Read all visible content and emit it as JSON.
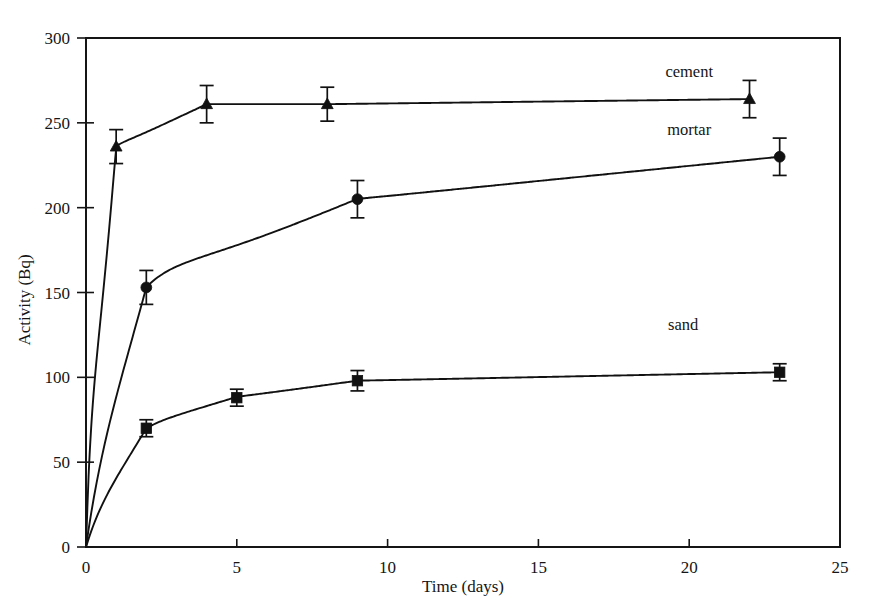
{
  "chart_data": {
    "type": "line",
    "title": "",
    "subtitle": "",
    "xlabel": "Time (days)",
    "ylabel": "Activity (Bq)",
    "xlim": [
      0,
      25
    ],
    "ylim": [
      0,
      300
    ],
    "xticks": [
      0,
      5,
      10,
      15,
      20,
      25
    ],
    "xtick_labels": [
      "0",
      "5",
      "10",
      "15",
      "20",
      "25"
    ],
    "yticks": [
      0,
      50,
      100,
      150,
      200,
      250,
      300
    ],
    "ytick_labels": [
      "0",
      "50",
      "100",
      "150",
      "200",
      "250",
      "300"
    ],
    "grid": false,
    "legend_position": "inline-right-of-curve",
    "marker_colors": {
      "cement": "#111111",
      "mortar": "#111111",
      "sand": "#111111"
    },
    "series": [
      {
        "name": "cement",
        "marker": "triangle",
        "x": [
          0,
          1,
          4,
          8,
          22
        ],
        "values": [
          0,
          236,
          261,
          261,
          264
        ],
        "errors": [
          0,
          10,
          11,
          10,
          11
        ],
        "label_x": 20.0,
        "label_y": 277
      },
      {
        "name": "mortar",
        "marker": "circle",
        "x": [
          0,
          2,
          9,
          23
        ],
        "values": [
          0,
          153,
          205,
          230
        ],
        "errors": [
          0,
          10,
          11,
          11
        ],
        "label_x": 20.0,
        "label_y": 243
      },
      {
        "name": "sand",
        "marker": "square",
        "x": [
          0,
          2,
          5,
          9,
          23
        ],
        "values": [
          0,
          70,
          88,
          98,
          103
        ],
        "errors": [
          0,
          5,
          5,
          6,
          5
        ],
        "label_x": 19.8,
        "label_y": 128
      }
    ]
  },
  "axes": {
    "x_title": "Time (days)",
    "y_title": "Activity (Bq)"
  },
  "labels": {
    "cement": "cement",
    "mortar": "mortar",
    "sand": "sand"
  },
  "ticks": {
    "x": [
      "0",
      "5",
      "10",
      "15",
      "20",
      "25"
    ],
    "y": [
      "0",
      "50",
      "100",
      "150",
      "200",
      "250",
      "300"
    ]
  }
}
